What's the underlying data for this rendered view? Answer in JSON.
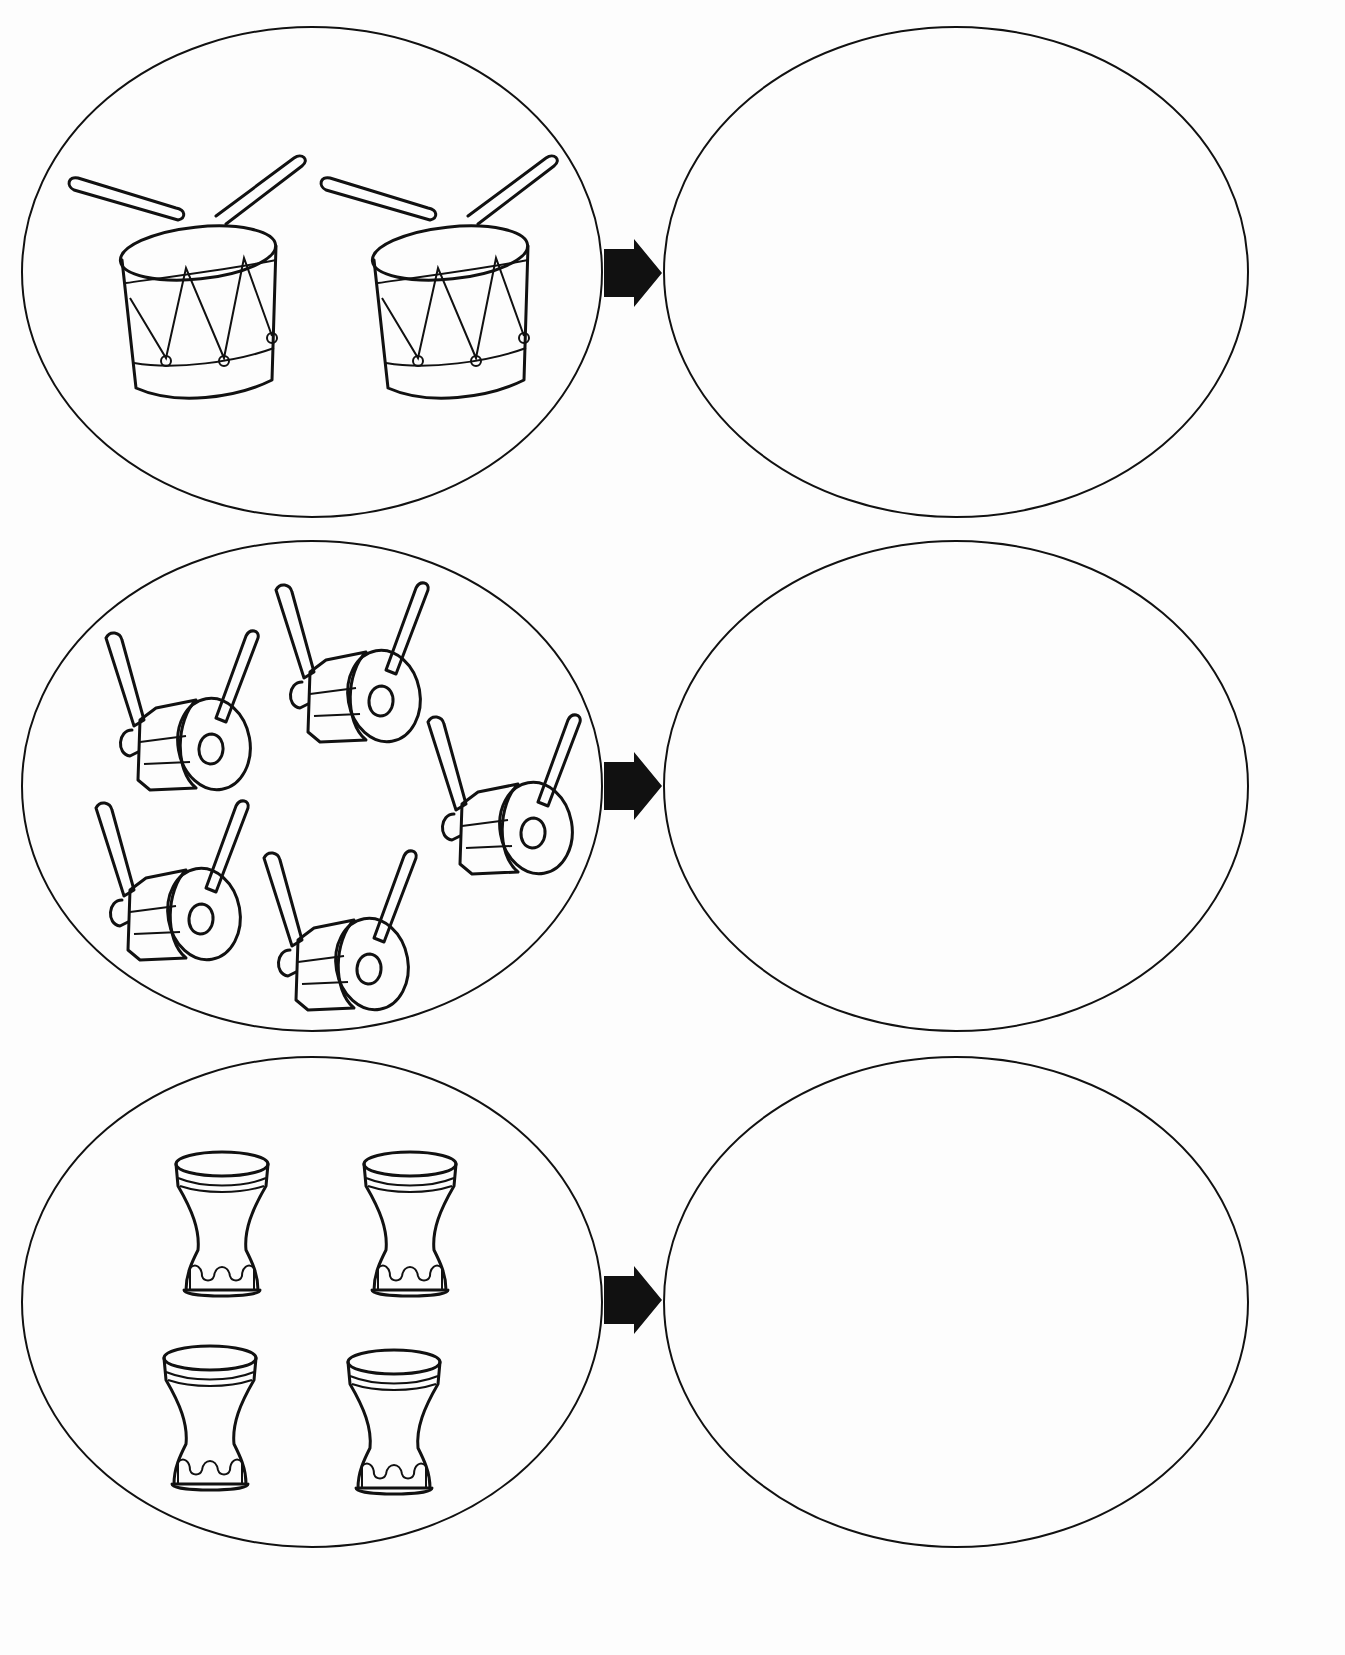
{
  "worksheet": {
    "type": "counting-worksheet",
    "rows": [
      {
        "id": "row-1",
        "item": "snare-drum",
        "count": 2,
        "answer_oval": "empty"
      },
      {
        "id": "row-2",
        "item": "side-drum",
        "count": 5,
        "answer_oval": "empty"
      },
      {
        "id": "row-3",
        "item": "darbuka-drum",
        "count": 4,
        "answer_oval": "empty"
      }
    ],
    "arrow_icon": "right-arrow-icon",
    "colors": {
      "line": "#111111",
      "background": "#fdfdfd"
    }
  }
}
